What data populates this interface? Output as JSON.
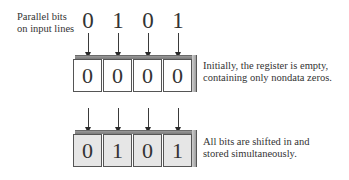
{
  "diagram": {
    "input_label_line1": "Parallel bits",
    "input_label_line2": "on input lines",
    "input_bits": [
      "0",
      "1",
      "0",
      "1"
    ],
    "initial_register": {
      "bits": [
        "0",
        "0",
        "0",
        "0"
      ],
      "caption_line1": "Initially, the register is empty,",
      "caption_line2": "containing only nondata zeros."
    },
    "final_register": {
      "bits": [
        "0",
        "1",
        "0",
        "1"
      ],
      "caption_line1": "All bits are shifted in and",
      "caption_line2": "stored simultaneously."
    },
    "colors": {
      "empty_cell_fill": "#ffffff",
      "filled_cell_fill": "#e6e6e6",
      "outline": "#555555",
      "top_face": "#8a8a8a"
    }
  }
}
